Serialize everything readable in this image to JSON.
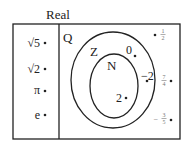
{
  "diagram": {
    "title": "Real",
    "colors": {
      "line": "#222222",
      "text": "#222222",
      "fraction_text": "#777777",
      "background": "#ffffff"
    },
    "irrational_region": {
      "items": [
        {
          "label": "√5"
        },
        {
          "label": "√2"
        },
        {
          "label": "π"
        },
        {
          "label": "e"
        }
      ]
    },
    "rational_region": {
      "label": "Q",
      "outside_integers": [
        {
          "sign": "",
          "num": "1",
          "den": "2"
        },
        {
          "sign": "",
          "num": "7",
          "den": "4"
        },
        {
          "sign": "−",
          "num": "3",
          "den": "5"
        }
      ],
      "integers": {
        "label": "Z",
        "items": [
          {
            "label": "0"
          },
          {
            "label": "−2"
          }
        ],
        "naturals": {
          "label": "N",
          "items": [
            {
              "label": "2"
            }
          ]
        }
      }
    }
  }
}
